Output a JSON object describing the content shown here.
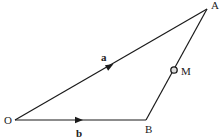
{
  "diagram": {
    "type": "vector-triangle",
    "stroke_color": "#1a1a1a",
    "points": {
      "O": {
        "label": "O",
        "x": 15,
        "y": 120
      },
      "A": {
        "label": "A",
        "x": 207,
        "y": 9
      },
      "B": {
        "label": "B",
        "x": 146,
        "y": 120
      },
      "M": {
        "label": "M",
        "x": 174,
        "y": 70
      }
    },
    "vectors": {
      "a": {
        "label": "a",
        "from": "O",
        "to": "A"
      },
      "b": {
        "label": "b",
        "from": "O",
        "to": "B"
      }
    },
    "segments": [
      {
        "from": "O",
        "to": "A"
      },
      {
        "from": "O",
        "to": "B"
      },
      {
        "from": "B",
        "to": "A"
      }
    ],
    "marked_point": {
      "label": "M",
      "on_segment": "BA",
      "marker": "hollow-circle"
    }
  }
}
